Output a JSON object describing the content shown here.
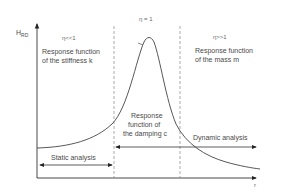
{
  "diagram": {
    "y_axis_label": "H",
    "y_axis_subscript": "RD",
    "x_axis_label": "r",
    "regions": [
      {
        "condition": "η<<1",
        "title_line1": "Response function",
        "title_line2": "of the stiffness k"
      },
      {
        "condition": "η = 1"
      },
      {
        "condition": "η>>1",
        "title_line1": "Response function",
        "title_line2": "of the mass m"
      }
    ],
    "damping": {
      "line1": "Response",
      "line2": "function of",
      "line3": "the damping c"
    },
    "static_analysis": "Static analysis",
    "dynamic_analysis": "Dynamic analysis",
    "colors": {
      "line": "#333333",
      "text": "#4a4a4a",
      "dashed": "#888888"
    }
  }
}
